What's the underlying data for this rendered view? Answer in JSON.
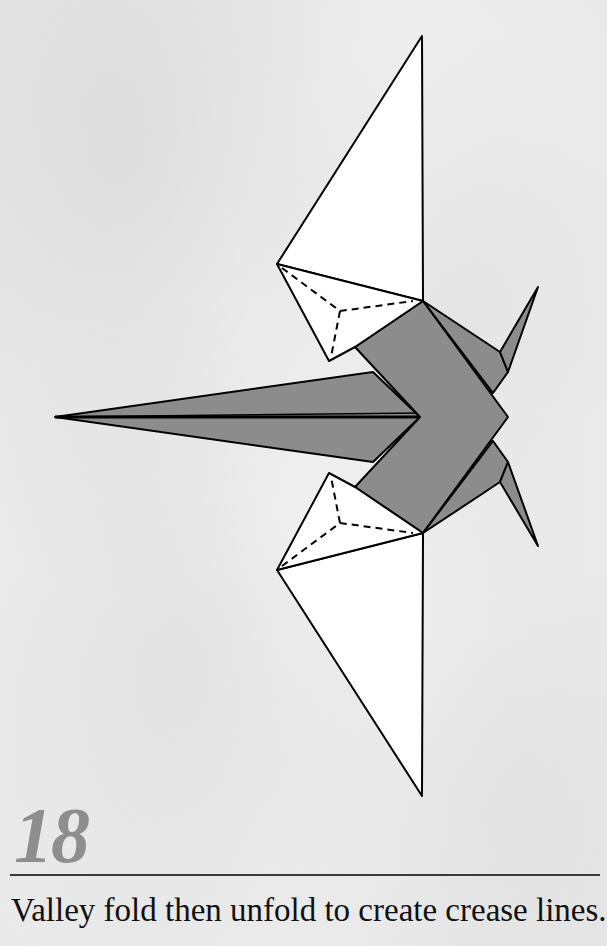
{
  "step": {
    "number": "18",
    "instruction": "Valley fold then unfold to create crease lines."
  },
  "diagram": {
    "colors": {
      "paper_front": "#ffffff",
      "paper_back": "#8c8c8c",
      "outline": "#000000",
      "step_number": "#8e8e8e"
    },
    "line_types": [
      "solid-edge",
      "dashed-valley-fold-crease"
    ]
  }
}
